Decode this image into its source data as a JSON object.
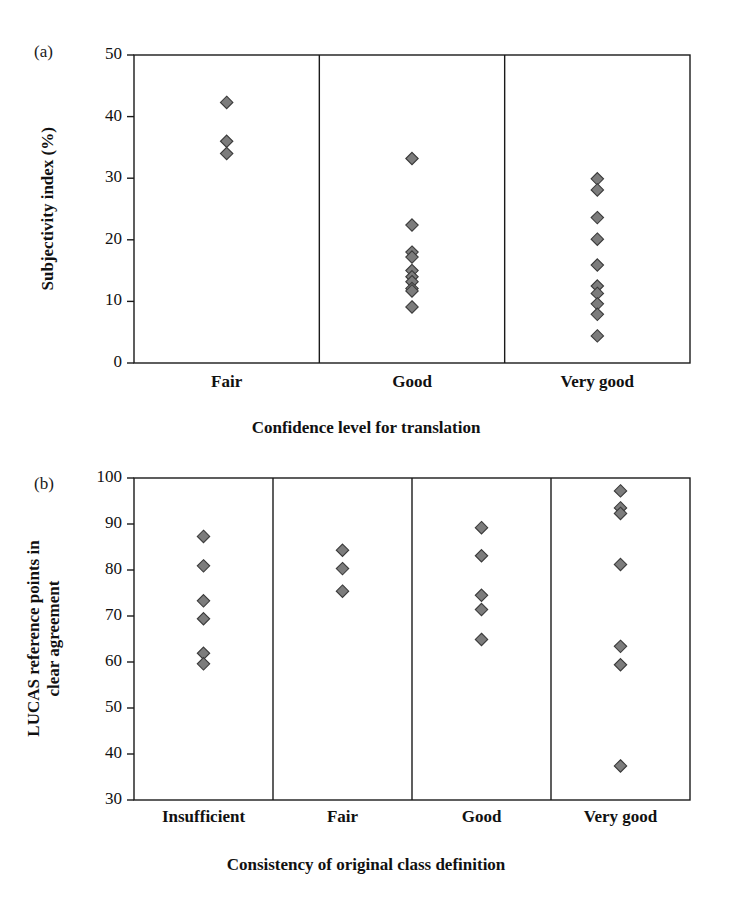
{
  "figure": {
    "background": "#ffffff",
    "marker_fill": "#7c7c7c",
    "marker_stroke": "#3a3a3a",
    "axis_color": "#1a1a1a"
  },
  "panels": [
    {
      "tag": "(a)",
      "ylabel": "Subjectivity index (%)",
      "ylabel_lines": [
        "Subjectivity index (%)"
      ],
      "xlabel": "Confidence level for translation",
      "yticks": [
        "0",
        "10",
        "20",
        "30",
        "40",
        "50"
      ],
      "categories": [
        "Fair",
        "Good",
        "Very good"
      ]
    },
    {
      "tag": "(b)",
      "ylabel": "LUCAS reference points in clear agreement",
      "ylabel_lines": [
        "LUCAS reference points in",
        "clear agreement"
      ],
      "xlabel": "Consistency of original class definition",
      "yticks": [
        "30",
        "40",
        "50",
        "60",
        "70",
        "80",
        "90",
        "100"
      ],
      "categories": [
        "Insufficient",
        "Fair",
        "Good",
        "Very good"
      ]
    }
  ],
  "chart_data": [
    {
      "type": "scatter",
      "panel": "(a)",
      "title": "",
      "xlabel": "Confidence level for translation",
      "ylabel": "Subjectivity index (%)",
      "ylim": [
        0,
        50
      ],
      "ytick_values": [
        0,
        10,
        20,
        30,
        40,
        50
      ],
      "grid": false,
      "legend": "none",
      "categories": [
        "Fair",
        "Good",
        "Very good"
      ],
      "series": [
        {
          "name": "Fair",
          "values": [
            42.3,
            36.0,
            34.0
          ]
        },
        {
          "name": "Good",
          "values": [
            33.2,
            22.4,
            18.0,
            17.2,
            15.0,
            14.0,
            13.2,
            12.1,
            11.7,
            9.1
          ]
        },
        {
          "name": "Very good",
          "values": [
            29.9,
            28.1,
            23.6,
            20.1,
            15.9,
            12.5,
            11.3,
            9.6,
            7.9,
            4.4
          ]
        }
      ]
    },
    {
      "type": "scatter",
      "panel": "(b)",
      "title": "",
      "xlabel": "Consistency of original class definition",
      "ylabel": "LUCAS reference points in clear agreement",
      "ylim": [
        30,
        100
      ],
      "ytick_values": [
        30,
        40,
        50,
        60,
        70,
        80,
        90,
        100
      ],
      "grid": false,
      "legend": "none",
      "categories": [
        "Insufficient",
        "Fair",
        "Good",
        "Very good"
      ],
      "series": [
        {
          "name": "Insufficient",
          "values": [
            87.3,
            80.9,
            73.3,
            69.4,
            61.9,
            59.6
          ]
        },
        {
          "name": "Fair",
          "values": [
            84.3,
            80.3,
            75.4
          ]
        },
        {
          "name": "Good",
          "values": [
            89.2,
            83.1,
            74.5,
            71.4,
            64.9
          ]
        },
        {
          "name": "Very good",
          "values": [
            97.2,
            93.5,
            92.3,
            81.2,
            63.4,
            59.4,
            37.4
          ]
        }
      ]
    }
  ]
}
